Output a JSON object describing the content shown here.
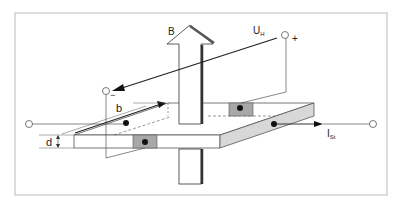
{
  "diagram": {
    "labels": {
      "magnetic_field": "B",
      "hall_voltage": "U",
      "hall_voltage_sub": "H",
      "plus": "+",
      "minus": "−",
      "width": "b",
      "thickness": "d",
      "control_current": "I",
      "control_current_sub": "St"
    },
    "colors": {
      "frame": "#bbbbbb",
      "plate_side": "#d8d8d8",
      "contact": "#a8a8a8",
      "line": "#222222"
    }
  }
}
